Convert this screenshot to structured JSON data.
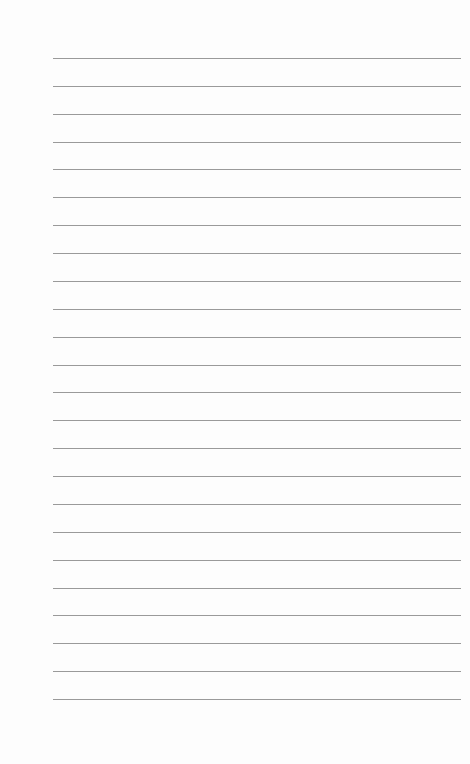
{
  "page": {
    "type": "lined-paper",
    "line_count": 24,
    "first_line_y": 58,
    "line_spacing": 27.87,
    "line_left": 53,
    "line_width": 408,
    "line_color": "#9a9a9a",
    "background_color": "#fdfdfd"
  }
}
